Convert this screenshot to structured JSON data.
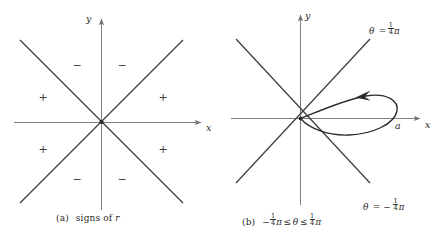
{
  "figure": {
    "width": 446,
    "height": 240,
    "background": "#ffffff",
    "line_color": "#3a3a3a",
    "axis_color": "#808080",
    "curve_color": "#2a2a2a",
    "text_color": "#2a2a2a"
  },
  "panel_a": {
    "caption_tag": "(a)",
    "caption_text": "signs of",
    "caption_var": "r",
    "axis_x_label": "x",
    "axis_y_label": "y",
    "signs": [
      {
        "symbol": "−",
        "x": 77,
        "y": 66
      },
      {
        "symbol": "−",
        "x": 122,
        "y": 66
      },
      {
        "symbol": "+",
        "x": 43,
        "y": 98
      },
      {
        "symbol": "+",
        "x": 163,
        "y": 98
      },
      {
        "symbol": "+",
        "x": 43,
        "y": 150
      },
      {
        "symbol": "+",
        "x": 163,
        "y": 150
      },
      {
        "symbol": "−",
        "x": 77,
        "y": 180
      },
      {
        "symbol": "−",
        "x": 122,
        "y": 180
      }
    ]
  },
  "panel_b": {
    "caption_tag": "(b)",
    "caption_minus": "−",
    "caption_frac_num": "1",
    "caption_frac_den": "4",
    "caption_pi": "π",
    "caption_rel1": "≤",
    "caption_theta": "θ",
    "caption_rel2": "≤",
    "caption_frac2_num": "1",
    "caption_frac2_den": "4",
    "caption_pi2": "π",
    "axis_x_label": "x",
    "axis_y_label": "y",
    "loop_vertex_label": "a",
    "upper_line_label": {
      "theta": "θ",
      "equals": "=",
      "num": "1",
      "den": "4",
      "pi": "π"
    },
    "lower_line_label": {
      "theta": "θ",
      "equals": "=",
      "minus": "−",
      "num": "1",
      "den": "4",
      "pi": "π"
    }
  }
}
